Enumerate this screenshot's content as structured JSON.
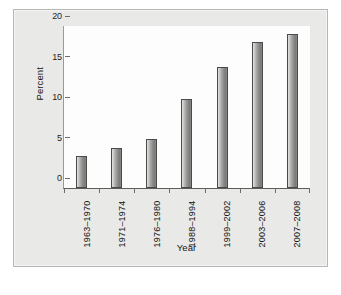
{
  "chart_data": {
    "type": "bar",
    "title": "",
    "xlabel": "Year",
    "ylabel": "Percent",
    "categories": [
      "1963–1970",
      "1971–1974",
      "1976–1980",
      "1988–1994",
      "1999–2002",
      "2003–2006",
      "2007–2008"
    ],
    "values": [
      4,
      5,
      6,
      11,
      15,
      18,
      19
    ],
    "ylim": [
      0,
      20
    ],
    "yticks": [
      0,
      5,
      10,
      15,
      20
    ],
    "ytick_labels": [
      "0",
      "5",
      "10",
      "15",
      "20"
    ],
    "grid": false,
    "legend": false,
    "orientation": "vertical",
    "bar_color": "#8d8d8b",
    "bar_edge_color": "#4a4a48",
    "plot_background": "#fdfdfd",
    "figure_background": "#e9e9e7"
  },
  "caption": {
    "text": ""
  }
}
